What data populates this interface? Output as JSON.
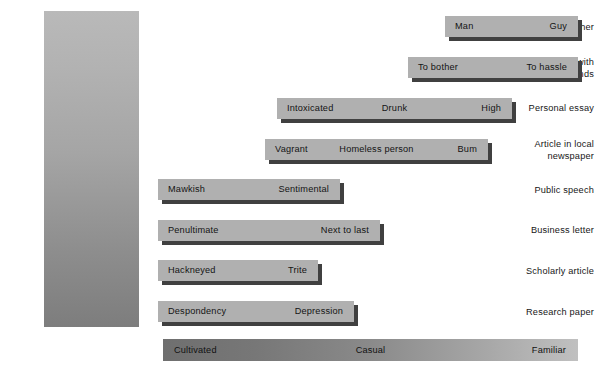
{
  "figure": {
    "type": "register-scale-diagram",
    "background_color": "#ffffff",
    "bar_color": "#b0b0b0",
    "bar_shadow_color": "#404040",
    "column_gradient_from": "#b9b9b9",
    "column_gradient_to": "#7d7d7d",
    "summary_gradient_from": "#6f6f6f",
    "summary_gradient_to": "#c0c0c0"
  },
  "categories": [
    {
      "label": "Letter to mother"
    },
    {
      "label": "Conversation with friends"
    },
    {
      "label": "Personal essay"
    },
    {
      "label": "Article in local newspaper"
    },
    {
      "label": "Public speech"
    },
    {
      "label": "Business letter"
    },
    {
      "label": "Scholarly article"
    },
    {
      "label": "Research paper"
    }
  ],
  "rows": [
    {
      "category": "Letter to mother",
      "left": 445,
      "top": 16,
      "width": 133,
      "terms": [
        {
          "text": "Man",
          "align": "left"
        },
        {
          "text": "Guy",
          "align": "right"
        }
      ]
    },
    {
      "category": "Conversation with friends",
      "left": 408,
      "top": 57,
      "width": 170,
      "terms": [
        {
          "text": "To bother",
          "align": "left"
        },
        {
          "text": "To hassle",
          "align": "right"
        }
      ]
    },
    {
      "category": "Personal essay",
      "left": 277,
      "top": 98,
      "width": 235,
      "terms": [
        {
          "text": "Intoxicated",
          "align": "left"
        },
        {
          "text": "Drunk",
          "align": "center"
        },
        {
          "text": "High",
          "align": "right"
        }
      ]
    },
    {
      "category": "Article in local newspaper",
      "left": 265,
      "top": 139,
      "width": 223,
      "terms": [
        {
          "text": "Vagrant",
          "align": "left"
        },
        {
          "text": "Homeless person",
          "align": "center"
        },
        {
          "text": "Bum",
          "align": "right"
        }
      ]
    },
    {
      "category": "Public speech",
      "left": 158,
      "top": 179,
      "width": 182,
      "terms": [
        {
          "text": "Mawkish",
          "align": "left"
        },
        {
          "text": "Sentimental",
          "align": "right"
        }
      ]
    },
    {
      "category": "Business letter",
      "left": 158,
      "top": 220,
      "width": 222,
      "terms": [
        {
          "text": "Penultimate",
          "align": "left"
        },
        {
          "text": "Next to last",
          "align": "right"
        }
      ]
    },
    {
      "category": "Scholarly article",
      "left": 158,
      "top": 260,
      "width": 160,
      "terms": [
        {
          "text": "Hackneyed",
          "align": "left"
        },
        {
          "text": "Trite",
          "align": "right"
        }
      ]
    },
    {
      "category": "Research paper",
      "left": 158,
      "top": 301,
      "width": 196,
      "terms": [
        {
          "text": "Despondency",
          "align": "left"
        },
        {
          "text": "Depression",
          "align": "right"
        }
      ]
    }
  ],
  "summary_scale": {
    "terms": [
      {
        "text": "Cultivated",
        "align": "left"
      },
      {
        "text": "Casual",
        "align": "center"
      },
      {
        "text": "Familiar",
        "align": "right"
      }
    ]
  }
}
